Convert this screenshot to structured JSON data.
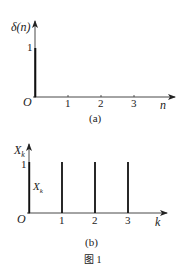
{
  "figure_caption": "图 1",
  "panel_a": {
    "ylabel": "δ(n)",
    "xlabel": "n",
    "origin": "O",
    "ytick": "1",
    "xticks": [
      "1",
      "2",
      "3"
    ],
    "subcaption": "(a)",
    "impulse": {
      "n": 0,
      "value": 1
    }
  },
  "panel_b": {
    "ylabel_main": "X",
    "ylabel_sub": "k",
    "inner_label_main": "X",
    "inner_label_sub": "k",
    "xlabel": "k",
    "origin": "O",
    "ytick": "1",
    "xticks": [
      "1",
      "2",
      "3"
    ],
    "subcaption": "(b)",
    "bars": [
      {
        "k": 0,
        "value": 1
      },
      {
        "k": 1,
        "value": 1
      },
      {
        "k": 2,
        "value": 1
      },
      {
        "k": 3,
        "value": 1
      }
    ]
  },
  "colors": {
    "ink": "#222222",
    "axis": "#333333"
  }
}
